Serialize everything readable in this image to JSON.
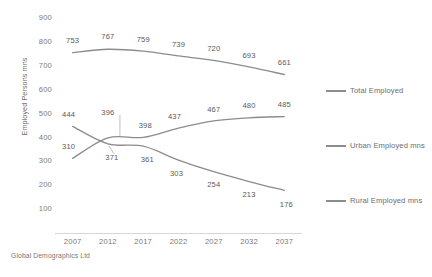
{
  "chart_data": {
    "type": "line",
    "title": "",
    "xlabel": "",
    "ylabel": "Employed Persons mns",
    "categories": [
      "2007",
      "2012",
      "2017",
      "2022",
      "2027",
      "2032",
      "2037"
    ],
    "ylim": [
      0,
      900
    ],
    "ytick_labels": [
      "900",
      "800",
      "700",
      "600",
      "500",
      "400",
      "300",
      "200",
      "100"
    ],
    "ytick_values": [
      900,
      800,
      700,
      600,
      500,
      400,
      300,
      200,
      100
    ],
    "grid": false,
    "legend_position": "right",
    "line_color": "#8c8c8c",
    "label_color": "#595959",
    "series": [
      {
        "name": "Total Employed",
        "values": [
          753,
          767,
          759,
          739,
          720,
          693,
          661
        ],
        "labels": [
          "753",
          "767",
          "759",
          "739",
          "720",
          "693",
          "661"
        ]
      },
      {
        "name": "Urban Employed mns",
        "values": [
          310,
          396,
          398,
          437,
          467,
          480,
          485
        ],
        "labels": [
          "310",
          "396",
          "398",
          "437",
          "467",
          "480",
          "485"
        ]
      },
      {
        "name": "Rural Employed mns",
        "values": [
          444,
          371,
          361,
          303,
          254,
          213,
          176
        ],
        "labels": [
          "444",
          "371",
          "361",
          "303",
          "254",
          "213",
          "176"
        ]
      }
    ]
  },
  "legend": {
    "items": [
      {
        "label": "Total Employed"
      },
      {
        "label": "Urban Employed mns"
      },
      {
        "label": "Rural Employed mns"
      }
    ]
  },
  "footer": {
    "source": "Global Demographics Ltd"
  }
}
